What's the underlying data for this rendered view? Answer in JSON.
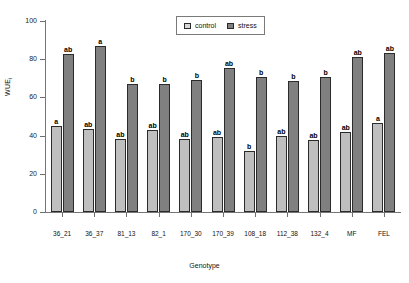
{
  "chart_data": {
    "type": "bar",
    "title": "",
    "xlabel": "Genotype",
    "ylabel": "WUE",
    "ylabel_sub": "i",
    "ylim": [
      0,
      100
    ],
    "yticks": [
      0,
      20,
      40,
      60,
      80,
      100
    ],
    "grid": false,
    "legend_position": "top-center",
    "categories": [
      "36_21",
      "36_37",
      "81_13",
      "82_1",
      "170_30",
      "170_39",
      "108_18",
      "112_38",
      "132_4",
      "MF",
      "FEL"
    ],
    "series": [
      {
        "name": "control",
        "color": "#bfbfbf",
        "values": [
          45,
          43.5,
          38,
          43,
          38,
          39.5,
          32,
          40,
          37.5,
          42,
          46.5
        ],
        "annotations": [
          "a",
          "ab",
          "ab",
          "ab",
          "ab",
          "ab",
          "b",
          "ab",
          "ab",
          "ab",
          "a"
        ]
      },
      {
        "name": "stress",
        "color": "#808080",
        "values": [
          82.5,
          87,
          67,
          67,
          69,
          75.5,
          70.5,
          68.5,
          70.5,
          81,
          83
        ],
        "annotations": [
          "ab",
          "a",
          "b",
          "b",
          "b",
          "ab",
          "b",
          "b",
          "b",
          "ab",
          "ab"
        ]
      }
    ]
  },
  "legend": {
    "items": [
      {
        "label": "control",
        "key": "control"
      },
      {
        "label": "stress",
        "key": "stress"
      }
    ]
  }
}
